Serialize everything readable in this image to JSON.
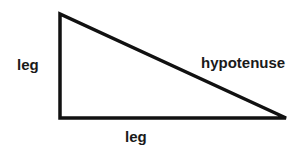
{
  "diagram": {
    "type": "right-triangle",
    "stroke_color": "#111111",
    "background": "#ffffff",
    "vertices": {
      "top": [
        60,
        14
      ],
      "right_angle": [
        60,
        118
      ],
      "right": [
        286,
        118
      ]
    },
    "labels": {
      "vertical_leg": "leg",
      "horizontal_leg": "leg",
      "hypotenuse": "hypotenuse"
    }
  }
}
